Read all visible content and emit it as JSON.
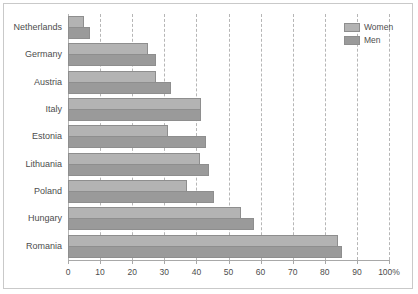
{
  "chart_data": {
    "type": "bar",
    "orientation": "horizontal",
    "title": "",
    "subtitle": "",
    "xlabel": "",
    "ylabel": "",
    "xlim": [
      0,
      100
    ],
    "grid": true,
    "grid_axis": "x",
    "grid_style": "dashed",
    "legend_position": "top-right",
    "categories": [
      "Netherlands",
      "Germany",
      "Austria",
      "Italy",
      "Estonia",
      "Lithuania",
      "Poland",
      "Hungary",
      "Romania"
    ],
    "series": [
      {
        "name": "Women",
        "color": "#b3b3b3",
        "values": [
          5,
          25,
          27.5,
          41.5,
          31,
          41,
          37,
          54,
          84
        ]
      },
      {
        "name": "Men",
        "color": "#9a9a9a",
        "values": [
          7,
          27.5,
          32,
          41.5,
          43,
          44,
          45.5,
          58,
          85.5
        ]
      }
    ],
    "xticks": [
      0,
      10,
      20,
      30,
      40,
      50,
      60,
      70,
      80,
      90,
      100
    ],
    "xtick_labels": [
      "0",
      "10",
      "20",
      "30",
      "40",
      "50",
      "60",
      "70",
      "80",
      "90",
      "100%"
    ]
  },
  "legend": {
    "entries": [
      {
        "label": "Women",
        "swatch": "women"
      },
      {
        "label": "Men",
        "swatch": "men"
      }
    ]
  },
  "colors": {
    "women": "#b3b3b3",
    "men": "#9a9a9a",
    "bar_border": "#8e8e8e",
    "gridline": "#b6b6b6",
    "axis": "#a8a8a8",
    "text": "#4d4d4d",
    "frame": "#c9c9c9",
    "background": "#ffffff"
  }
}
